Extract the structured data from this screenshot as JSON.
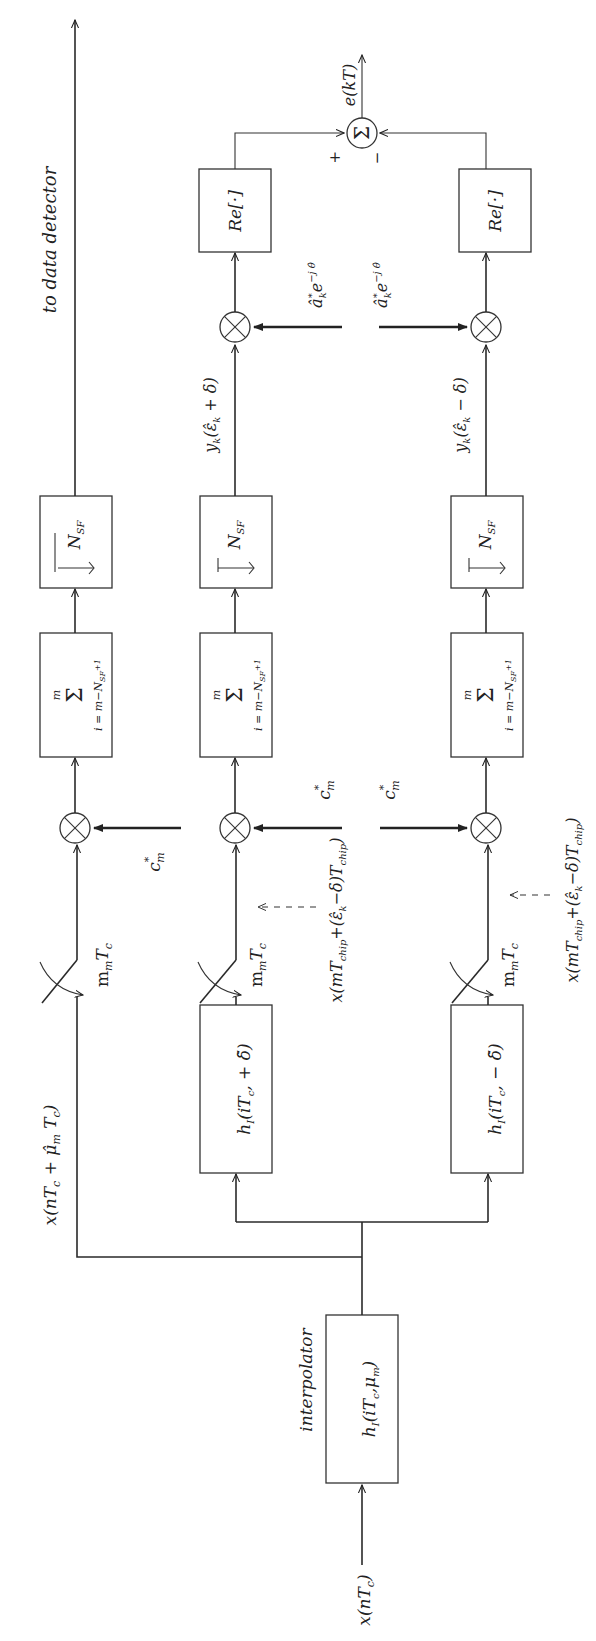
{
  "diagram": {
    "orientation": "rotated 90 degrees counter-clockwise (signal flows bottom to top)",
    "input_label": "x(nT_c)",
    "interpolator": {
      "caption": "interpolator",
      "label": "h_I(iT_c, μ_m)"
    },
    "top_branch": {
      "signal_label": "x(nT_c + μ̂_m T_c)",
      "sampler_label": "m_m T_c",
      "code_label": "c*_m",
      "sum_label_top": "m",
      "sum_label_bottom": "i = m − N_SF + 1",
      "decimator_label": "N_SF",
      "output_label": "to data detector"
    },
    "early_branch": {
      "filter_label": "h_I(iT_c, + δ̃)",
      "sampler_label": "m_m T_c",
      "sample_annotation": "x(mT_chip + (ε̂_k − δ)T_chip)",
      "code_label": "c*_m",
      "sum_label_top": "m",
      "sum_label_bottom": "i = m − N_SF + 1",
      "decimator_label": "N_SF",
      "despread_output": "y_k(ε̂_k + δ)",
      "symbol_label": "â*_k e^{−j θ̂}",
      "real_part_label": "Re[·]"
    },
    "late_branch": {
      "filter_label": "h_I(iT_c, − δ̃)",
      "sampler_label": "m_m T_c",
      "sample_annotation": "x(mT_chip + (ε̂_k − δ)T_chip)",
      "code_label": "c*_m",
      "sum_label_top": "m",
      "sum_label_bottom": "i = m − N_SF + 1",
      "decimator_label": "N_SF",
      "despread_output": "y_k(ε̂_k − δ)",
      "symbol_label": "â*_k e^{−j θ̂}",
      "real_part_label": "Re[·]"
    },
    "summer": {
      "symbol": "Σ",
      "plus_sign": "+",
      "minus_sign": "−",
      "output_label": "e(kT)"
    },
    "text": {
      "x": "x",
      "nTc": "(nT",
      "c": "c",
      "close": ")",
      "hI": "h",
      "I": "I",
      "sigma": "Σ",
      "m": "m",
      "isum": "i = m−N",
      "SF": "SF",
      "plus1": "+1",
      "N": "N",
      "Re": "Re[·]",
      "c_star": "c",
      "star": "*",
      "sub_m": "m",
      "mm": "m",
      "Tc": "T",
      "interp": "interpolator",
      "todet": "to data detector",
      "ekT": "e(kT)",
      "plus": "+",
      "minus": "−",
      "iTc_mu": "(iT",
      "mu": "μ",
      "mu_close": ")",
      "filt_plus": "(iT",
      "filt_plus_tail": ", + δ̃)",
      "filt_minus_tail": ", − δ̃)",
      "mu_hat_label": "x(nT",
      "mu_hat_tail": " + μ̂",
      "mu_hat_Tc": " T",
      "yk_plus": "y",
      "k": "k",
      "eps_plus": "(ε̂",
      "eps_plus_tail": " + δ)",
      "eps_minus_tail": " − δ)",
      "ak": "â",
      "ak_exp": "e",
      "ak_exp_sup": "−j θ̂",
      "xmT": "x(mT",
      "chip": "chip",
      "eps_mid": "+(ε̂",
      "eps_mid_tail": "−δ)T"
    }
  }
}
